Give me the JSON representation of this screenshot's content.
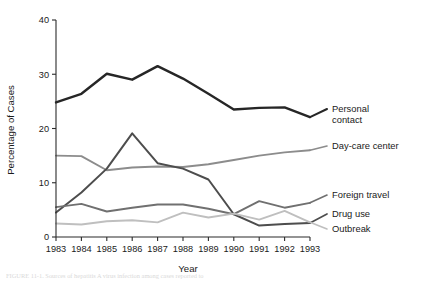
{
  "figure": {
    "background": "#ffffff",
    "caption": "FIGURE 11-1.  Sources of hepatitis A virus infection among cases reported to"
  },
  "chart_data": {
    "type": "line",
    "title": "",
    "xlabel": "Year",
    "ylabel": "Percentage of Cases",
    "x": [
      1983,
      1984,
      1985,
      1986,
      1987,
      1988,
      1989,
      1990,
      1991,
      1992,
      1993
    ],
    "categories": [
      "1983",
      "1984",
      "1985",
      "1986",
      "1987",
      "1988",
      "1989",
      "1990",
      "1991",
      "1992",
      "1993"
    ],
    "xlim": [
      1983,
      1993
    ],
    "ylim": [
      0,
      40
    ],
    "yticks": [
      0,
      10,
      20,
      30,
      40
    ],
    "ytick_labels": [
      "0",
      "10",
      "20",
      "30",
      "40"
    ],
    "grid": false,
    "legend_position": "right-of-axes-inline",
    "series": [
      {
        "name": "Personal contact",
        "color": "#262626",
        "width": 2.4,
        "values": [
          24.8,
          26.4,
          30.1,
          29.0,
          31.5,
          29.2,
          26.4,
          23.5,
          23.8,
          23.9,
          22.1
        ],
        "label_lines": [
          "Personal",
          "contact"
        ]
      },
      {
        "name": "Day-care center",
        "color": "#8c8c8c",
        "width": 1.9,
        "values": [
          15.0,
          14.9,
          12.3,
          12.8,
          13.0,
          12.9,
          13.4,
          14.2,
          15.0,
          15.6,
          16.0
        ],
        "label_lines": [
          "Day-care center"
        ]
      },
      {
        "name": "Drug use",
        "color": "#4d4d4d",
        "width": 2.0,
        "values": [
          4.5,
          8.2,
          12.6,
          19.1,
          13.6,
          12.6,
          10.6,
          4.2,
          2.1,
          2.4,
          2.6
        ],
        "label_lines": [
          "Drug use"
        ]
      },
      {
        "name": "Foreign travel",
        "color": "#707070",
        "width": 1.9,
        "values": [
          5.5,
          6.1,
          4.7,
          5.4,
          6.0,
          6.0,
          5.2,
          4.2,
          6.6,
          5.4,
          6.3
        ],
        "label_lines": [
          "Foreign travel"
        ]
      },
      {
        "name": "Outbreak",
        "color": "#bfbfbf",
        "width": 1.9,
        "values": [
          2.5,
          2.3,
          2.9,
          3.1,
          2.7,
          4.5,
          3.6,
          4.3,
          3.2,
          4.8,
          2.7
        ],
        "label_lines": [
          "Outbreak"
        ]
      }
    ],
    "legend_entries": [
      {
        "name": "Personal contact",
        "lines": [
          "Personal",
          "contact"
        ],
        "anchor_y": 112,
        "color": "#262626"
      },
      {
        "name": "Day-care center",
        "lines": [
          "Day-care center"
        ],
        "anchor_y": 149,
        "color": "#8c8c8c"
      },
      {
        "name": "Foreign travel",
        "lines": [
          "Foreign travel"
        ],
        "anchor_y": 198,
        "color": "#707070"
      },
      {
        "name": "Drug use",
        "lines": [
          "Drug use"
        ],
        "anchor_y": 217,
        "color": "#4d4d4d"
      },
      {
        "name": "Outbreak",
        "lines": [
          "Outbreak"
        ],
        "anchor_y": 232,
        "color": "#bfbfbf"
      }
    ]
  }
}
